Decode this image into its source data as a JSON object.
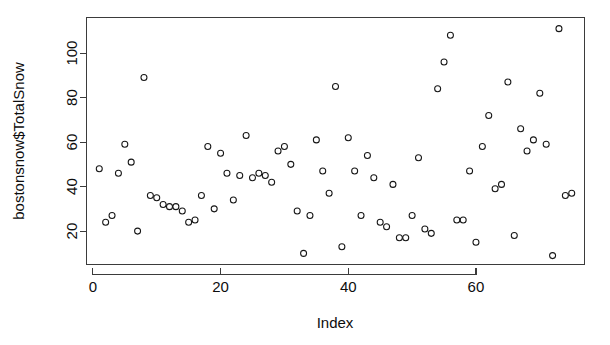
{
  "chart_data": {
    "type": "scatter",
    "title": "",
    "xlabel": "Index",
    "ylabel": "bostonsnow$TotalSnow",
    "xlim": [
      -1,
      77
    ],
    "ylim": [
      5,
      116
    ],
    "grid": false,
    "legend": null,
    "marker": {
      "shape": "open-circle",
      "radius": 3,
      "color": "#161616",
      "filled": false
    },
    "xticks": [
      0,
      20,
      40,
      60
    ],
    "xtick_labels": [
      "0",
      "20",
      "40",
      "60"
    ],
    "yticks": [
      20,
      40,
      60,
      80,
      100
    ],
    "ytick_labels": [
      "20",
      "40",
      "60",
      "80",
      "100"
    ],
    "x": [
      1,
      2,
      3,
      4,
      5,
      6,
      7,
      8,
      9,
      10,
      11,
      12,
      13,
      14,
      15,
      16,
      17,
      18,
      19,
      20,
      21,
      22,
      23,
      24,
      25,
      26,
      27,
      28,
      29,
      30,
      31,
      32,
      33,
      34,
      35,
      36,
      37,
      38,
      39,
      40,
      41,
      42,
      43,
      44,
      45,
      46,
      47,
      48,
      49,
      50,
      51,
      52,
      53,
      54,
      55,
      56,
      57,
      58,
      59,
      60,
      61,
      62,
      63,
      64,
      65,
      66,
      67,
      68,
      69,
      70,
      71,
      72,
      73,
      74,
      75
    ],
    "y": [
      48,
      24,
      27,
      46,
      59,
      51,
      20,
      89,
      36,
      35,
      32,
      31,
      31,
      29,
      24,
      25,
      36,
      58,
      30,
      55,
      46,
      34,
      45,
      63,
      44,
      46,
      45,
      42,
      56,
      58,
      50,
      29,
      10,
      27,
      61,
      47,
      37,
      85,
      13,
      62,
      47,
      27,
      54,
      44,
      24,
      22,
      41,
      17,
      17,
      27,
      53,
      21,
      19,
      84,
      96,
      108,
      25,
      25,
      47,
      15,
      58,
      72,
      39,
      41,
      87,
      18,
      66,
      56,
      61,
      82,
      59,
      9,
      111,
      36,
      37
    ]
  },
  "axes": {
    "y_title": "bostonsnow$TotalSnow",
    "x_title": "Index"
  }
}
